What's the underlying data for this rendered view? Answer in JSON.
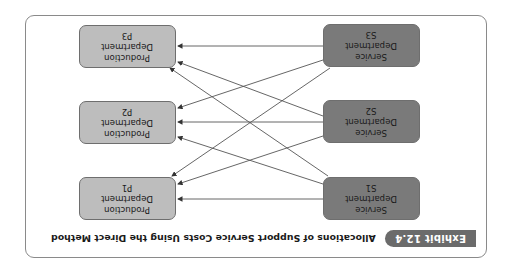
{
  "orientation": "rotated 180 degrees",
  "exhibit": {
    "badge": "Exhibit 12.4",
    "title": "Allocations of Support Service Costs Using the Direct Method"
  },
  "colors": {
    "service_fill": "#7a7a7a",
    "production_fill": "#bdbdbd",
    "badge_fill": "#6b6b6b",
    "arrow": "#444444"
  },
  "service_departments": [
    {
      "line1": "Service",
      "line2": "Department",
      "id": "S1"
    },
    {
      "line1": "Service",
      "line2": "Department",
      "id": "S2"
    },
    {
      "line1": "Service",
      "line2": "Department",
      "id": "S3"
    }
  ],
  "production_departments": [
    {
      "line1": "Production",
      "line2": "Department",
      "id": "P1"
    },
    {
      "line1": "Production",
      "line2": "Department",
      "id": "P2"
    },
    {
      "line1": "Production",
      "line2": "Department",
      "id": "P3"
    }
  ],
  "allocations": [
    {
      "from": "S1",
      "to": "P1"
    },
    {
      "from": "S1",
      "to": "P2"
    },
    {
      "from": "S1",
      "to": "P3"
    },
    {
      "from": "S2",
      "to": "P1"
    },
    {
      "from": "S2",
      "to": "P2"
    },
    {
      "from": "S2",
      "to": "P3"
    },
    {
      "from": "S3",
      "to": "P1"
    },
    {
      "from": "S3",
      "to": "P2"
    },
    {
      "from": "S3",
      "to": "P3"
    }
  ]
}
